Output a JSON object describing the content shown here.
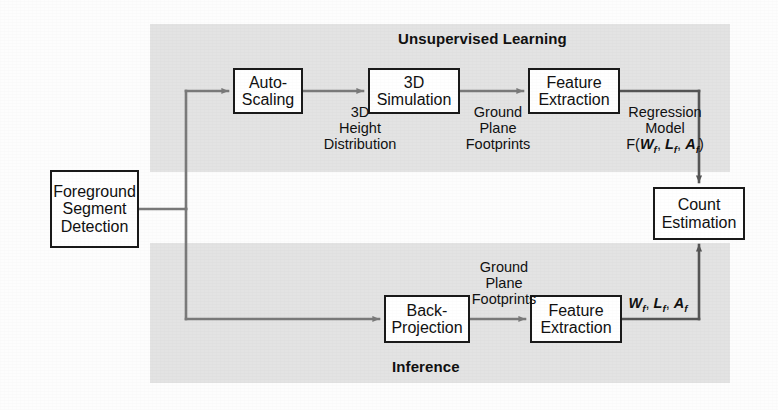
{
  "figure": {
    "width": 778,
    "height": 410,
    "background_color": "#fdfdfd",
    "panel_color": "#e3e3e3",
    "line_color": "#6f6f6f",
    "box_border_color": "#1a1a1a",
    "text_color": "#111111"
  },
  "panels": [
    {
      "id": "unsupervised",
      "label": "Unsupervised Learning",
      "x": 150,
      "y": 24,
      "width": 580,
      "height": 148,
      "label_x": 398,
      "label_y": 30
    },
    {
      "id": "inference",
      "label": "Inference",
      "x": 150,
      "y": 243,
      "width": 580,
      "height": 140,
      "label_x": 392,
      "label_y": 358
    }
  ],
  "nodes": [
    {
      "id": "foreground-segment-detection",
      "lines": [
        "Foreground",
        "Segment",
        "Detection"
      ],
      "x": 50,
      "y": 170,
      "width": 89,
      "height": 78
    },
    {
      "id": "auto-scaling",
      "lines": [
        "Auto-",
        "Scaling"
      ],
      "x": 233,
      "y": 68,
      "width": 70,
      "height": 46
    },
    {
      "id": "3d-simulation",
      "lines": [
        "3D",
        "Simulation"
      ],
      "x": 368,
      "y": 68,
      "width": 92,
      "height": 46
    },
    {
      "id": "feature-extraction-top",
      "lines": [
        "Feature",
        "Extraction"
      ],
      "x": 528,
      "y": 68,
      "width": 92,
      "height": 46
    },
    {
      "id": "count-estimation",
      "lines": [
        "Count",
        "Estimation"
      ],
      "x": 653,
      "y": 187,
      "width": 92,
      "height": 53
    },
    {
      "id": "back-projection",
      "lines": [
        "Back-",
        "Projection"
      ],
      "x": 384,
      "y": 295,
      "width": 86,
      "height": 48
    },
    {
      "id": "feature-extraction-bottom",
      "lines": [
        "Feature",
        "Extraction"
      ],
      "x": 530,
      "y": 295,
      "width": 92,
      "height": 48
    }
  ],
  "edge_labels": [
    {
      "id": "3d-height-distribution",
      "lines": [
        "3D",
        "Height",
        "Distribution"
      ],
      "x": 312,
      "y": 104,
      "width": 96
    },
    {
      "id": "ground-plane-footprints-top",
      "lines": [
        "Ground",
        "Plane",
        "Footprints"
      ],
      "x": 460,
      "y": 104,
      "width": 76
    },
    {
      "id": "regression-model",
      "lines": [
        "Regression",
        "Model",
        "F(Wf, Lf, Af)"
      ],
      "x": 620,
      "y": 104,
      "width": 90,
      "formula_prefix": "F(",
      "formula_vars": [
        {
          "sym": "W",
          "sub": "f",
          "tail": ","
        },
        {
          "sym": "L",
          "sub": "f",
          "tail": ","
        },
        {
          "sym": "A",
          "sub": "f",
          "tail": ""
        }
      ],
      "formula_suffix": ")"
    },
    {
      "id": "ground-plane-footprints-bottom",
      "lines": [
        "Ground",
        "Plane",
        "Footprints"
      ],
      "x": 466,
      "y": 259,
      "width": 76
    },
    {
      "id": "feature-vars",
      "lines": [
        "Wf, Lf, Af"
      ],
      "x": 622,
      "y": 295,
      "width": 72,
      "formula_vars": [
        {
          "sym": "W",
          "sub": "f",
          "tail": ","
        },
        {
          "sym": "L",
          "sub": "f",
          "tail": ","
        },
        {
          "sym": "A",
          "sub": "f",
          "tail": ""
        }
      ]
    }
  ],
  "connections": [
    {
      "id": "foreground-to-branch",
      "from": "foreground-segment-detection",
      "to": "branch-point"
    },
    {
      "id": "branch-to-auto-scaling",
      "from": "branch-point",
      "to": "auto-scaling"
    },
    {
      "id": "auto-scaling-to-3d-simulation",
      "from": "auto-scaling",
      "to": "3d-simulation"
    },
    {
      "id": "3d-simulation-to-feature-extraction",
      "from": "3d-simulation",
      "to": "feature-extraction-top"
    },
    {
      "id": "feature-extraction-to-count-estimation",
      "from": "feature-extraction-top",
      "to": "count-estimation"
    },
    {
      "id": "branch-to-back-projection",
      "from": "branch-point",
      "to": "back-projection"
    },
    {
      "id": "back-projection-to-feature-extraction",
      "from": "back-projection",
      "to": "feature-extraction-bottom"
    },
    {
      "id": "feature-extraction-bottom-to-count-estimation",
      "from": "feature-extraction-bottom",
      "to": "count-estimation"
    }
  ]
}
